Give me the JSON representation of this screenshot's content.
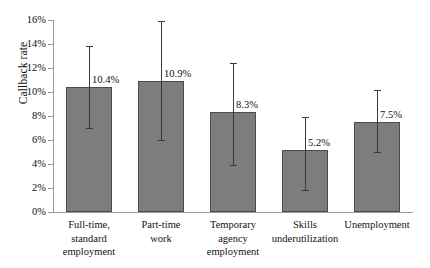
{
  "chart_data": {
    "type": "bar",
    "title": "",
    "subtitle": "",
    "xlabel": "",
    "ylabel": "Callback rate",
    "ylim": [
      0,
      16
    ],
    "grid": false,
    "legend": null,
    "y_tick_labels": [
      "16%",
      "14%",
      "12%",
      "10%",
      "8%",
      "6%",
      "4%",
      "2%",
      "0%"
    ],
    "y_tick_values": [
      16,
      14,
      12,
      10,
      8,
      6,
      4,
      2,
      0
    ],
    "categories": [
      "Full-time, standard employment",
      "Part-time work",
      "Temporary agency employment",
      "Skills underutilization",
      "Unemployment"
    ],
    "category_lines": [
      [
        "Full-time,",
        "standard",
        "employment"
      ],
      [
        "Part-time",
        "work"
      ],
      [
        "Temporary",
        "agency",
        "employment"
      ],
      [
        "Skills",
        "underutilization"
      ],
      [
        "Unemployment"
      ]
    ],
    "values": [
      10.4,
      10.9,
      8.3,
      5.2,
      7.5
    ],
    "value_labels": [
      "10.4%",
      "10.9%",
      "8.3%",
      "5.2%",
      "7.5%"
    ],
    "error_low": [
      7.0,
      6.0,
      3.9,
      1.8,
      5.0
    ],
    "error_high": [
      13.8,
      15.9,
      12.4,
      7.9,
      10.2
    ],
    "bar_color": "#7d7d7d",
    "bar_border_color": "#4d4d4d",
    "error_color": "#3a3a3a",
    "axis_color": "#9a9a9a",
    "text_color": "#111111",
    "background": "#ffffff"
  }
}
